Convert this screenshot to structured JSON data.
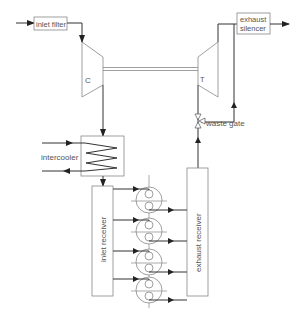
{
  "diagram": {
    "colors": {
      "line": "#333333",
      "outline": "#888888",
      "text": "#555555",
      "background": "#ffffff"
    },
    "labels": {
      "inlet_filter": "inlet filter",
      "exhaust_silencer_line1": "exhaust",
      "exhaust_silencer_line2": "silencer",
      "compressor": "C",
      "turbine": "T",
      "intercooler": "intercooler",
      "waste_gate": "waste gate",
      "inlet_receiver": "inlet receiver",
      "exhaust_receiver": "exhaust receiver"
    },
    "components": [
      "inlet filter",
      "compressor (C)",
      "shaft",
      "turbine (T)",
      "exhaust silencer",
      "intercooler",
      "waste gate",
      "inlet receiver",
      "cylinders",
      "exhaust receiver"
    ],
    "cylinders": [
      {
        "id": 1,
        "cx": 149,
        "cy": 200
      },
      {
        "id": 2,
        "cx": 149,
        "cy": 231
      },
      {
        "id": 3,
        "cx": 149,
        "cy": 262
      },
      {
        "id": 4,
        "cx": 149,
        "cy": 293
      }
    ]
  }
}
